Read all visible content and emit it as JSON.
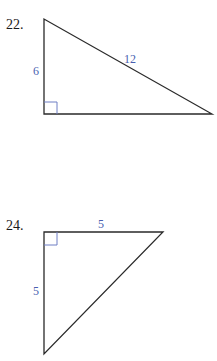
{
  "colors": {
    "line": "#2a2a2a",
    "label": "#4a5fb0",
    "right_angle": "#6f7fc4"
  },
  "problems": [
    {
      "number": "22.",
      "vertices": {
        "top": [
          44,
          19
        ],
        "right_angle": [
          44,
          114
        ],
        "right": [
          212,
          114
        ]
      },
      "labels": {
        "vertical_leg": "6",
        "hypotenuse": "12"
      }
    },
    {
      "number": "24.",
      "vertices": {
        "right_angle": [
          44,
          232
        ],
        "top_right": [
          163,
          232
        ],
        "bottom": [
          44,
          354
        ]
      },
      "labels": {
        "horizontal_leg": "5",
        "vertical_leg": "5"
      }
    }
  ]
}
